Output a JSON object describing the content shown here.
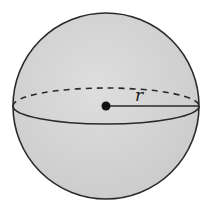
{
  "figure": {
    "radius_label": "r",
    "colors": {
      "fill": "#d4d4d4",
      "stroke": "#2a2a2a",
      "background": "#ffffff"
    }
  }
}
